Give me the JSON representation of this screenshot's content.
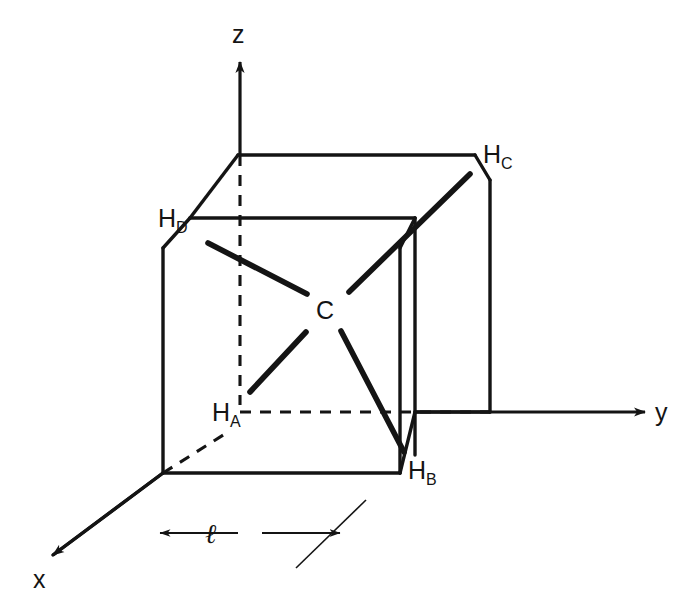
{
  "figure": {
    "kind": "methane-in-cube-coordinate-diagram",
    "background_color": "#ffffff",
    "stroke_color": "#141414",
    "width": 680,
    "height": 608
  },
  "axes": {
    "z": {
      "label": "z",
      "label_x": 232,
      "label_y": 22,
      "arrow_from": [
        240,
        155
      ],
      "arrow_to": [
        240,
        62
      ]
    },
    "y": {
      "label": "y",
      "label_x": 655,
      "label_y": 400,
      "arrow_from": [
        415,
        412
      ],
      "arrow_to": [
        645,
        412
      ]
    },
    "x": {
      "label": "x",
      "label_x": 33,
      "label_y": 567,
      "arrow_from": [
        163,
        473
      ],
      "arrow_to": [
        53,
        555
      ]
    }
  },
  "atoms": [
    {
      "id": "carbon",
      "label": "C",
      "sub": "",
      "label_x": 316,
      "label_y": 298,
      "x": 327,
      "y": 310
    },
    {
      "id": "hydrogen-a",
      "label": "H",
      "sub": "A",
      "label_x": 212,
      "label_y": 400,
      "x": 240,
      "y": 400
    },
    {
      "id": "hydrogen-b",
      "label": "H",
      "sub": "B",
      "label_x": 408,
      "label_y": 458,
      "x": 405,
      "y": 455
    },
    {
      "id": "hydrogen-c",
      "label": "H",
      "sub": "C",
      "label_x": 483,
      "label_y": 142,
      "x": 470,
      "y": 175
    },
    {
      "id": "hydrogen-d",
      "label": "H",
      "sub": "D",
      "label_x": 158,
      "label_y": 206,
      "x": 208,
      "y": 243
    }
  ],
  "bonds": [
    {
      "from": "carbon",
      "to": "hydrogen-d",
      "x1": 307,
      "y1": 294,
      "x2": 208,
      "y2": 243
    },
    {
      "from": "carbon",
      "to": "hydrogen-c",
      "x1": 349,
      "y1": 292,
      "x2": 470,
      "y2": 174
    },
    {
      "from": "carbon",
      "to": "hydrogen-a",
      "x1": 306,
      "y1": 332,
      "x2": 250,
      "y2": 392
    },
    {
      "from": "carbon",
      "to": "hydrogen-b",
      "x1": 341,
      "y1": 331,
      "x2": 404,
      "y2": 452
    }
  ],
  "cube": {
    "edge_label": {
      "text": "ℓ",
      "x": 205,
      "y": 521
    },
    "dimension_arrows": {
      "left": {
        "from": [
          238,
          533
        ],
        "to": [
          160,
          533
        ]
      },
      "right": {
        "from": [
          262,
          533
        ],
        "to": [
          340,
          533
        ]
      }
    },
    "solid_edges": [
      [
        238,
        155,
        475,
        155
      ],
      [
        238,
        155,
        190,
        218
      ],
      [
        190,
        218,
        415,
        218
      ],
      [
        415,
        218,
        415,
        455
      ],
      [
        190,
        218,
        163,
        248
      ],
      [
        163,
        248,
        163,
        473
      ],
      [
        163,
        473,
        400,
        473
      ],
      [
        400,
        473,
        400,
        248
      ],
      [
        400,
        248,
        415,
        218
      ],
      [
        475,
        155,
        490,
        180
      ],
      [
        490,
        180,
        490,
        412
      ],
      [
        490,
        412,
        415,
        412
      ],
      [
        415,
        412,
        400,
        473
      ],
      [
        163,
        473,
        53,
        555
      ]
    ],
    "dashed_edges": [
      [
        240,
        155,
        240,
        405
      ],
      [
        240,
        412,
        490,
        412
      ],
      [
        163,
        473,
        228,
        432
      ]
    ],
    "tick_marks": []
  },
  "caption": {
    "edge_length_symbol": "ℓ"
  }
}
